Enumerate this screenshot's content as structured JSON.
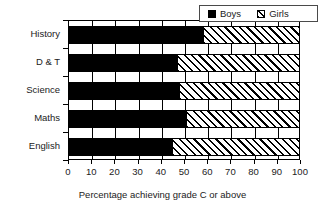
{
  "chart_data": {
    "type": "bar",
    "orientation": "horizontal",
    "stacked": true,
    "title": "",
    "xlabel": "Percentage achieving grade C or above",
    "ylabel": "",
    "categories": [
      "English",
      "Maths",
      "Science",
      "D & T",
      "History"
    ],
    "series": [
      {
        "name": "Boys",
        "values": [
          45,
          51,
          48,
          47,
          58
        ]
      },
      {
        "name": "Girls",
        "values": [
          55,
          49,
          52,
          53,
          42
        ]
      }
    ],
    "xlim": [
      0,
      100
    ],
    "xticks": [
      0,
      10,
      20,
      30,
      40,
      50,
      60,
      70,
      80,
      90,
      100
    ],
    "xtick_labels": [
      "0",
      "10",
      "20",
      "30",
      "40",
      "50",
      "60",
      "70",
      "80",
      "90",
      "100"
    ],
    "grid": true,
    "grid_axis": "x",
    "legend": {
      "position": "top-right",
      "entries": [
        {
          "label": "Boys",
          "fill": "solid-black",
          "color": "#000000"
        },
        {
          "label": "Girls",
          "fill": "diagonal-hatch",
          "color": "#000000"
        }
      ]
    }
  },
  "axis": {
    "x_title": "Percentage achieving grade C or above"
  },
  "legend": {
    "boys_label": "Boys",
    "girls_label": "Girls"
  }
}
